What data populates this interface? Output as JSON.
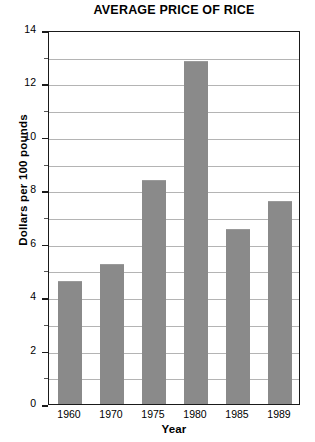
{
  "chart_data": {
    "type": "bar",
    "title": "AVERAGE PRICE OF RICE",
    "xlabel": "Year",
    "ylabel": "Dollars per 100 pounds",
    "categories": [
      "1960",
      "1970",
      "1975",
      "1980",
      "1985",
      "1989"
    ],
    "values": [
      4.6,
      5.25,
      8.4,
      12.85,
      6.55,
      7.6
    ],
    "ylim": [
      0,
      14
    ],
    "ytick_step": 2,
    "yticks": [
      "0",
      "2",
      "4",
      "6",
      "8",
      "10",
      "12",
      "14"
    ],
    "gridline_step": 1,
    "grid": true,
    "legend": "none",
    "bar_color": "#8a8a8a",
    "axis_color": "#1a1a1a",
    "grid_color": "#b4b4b4"
  }
}
